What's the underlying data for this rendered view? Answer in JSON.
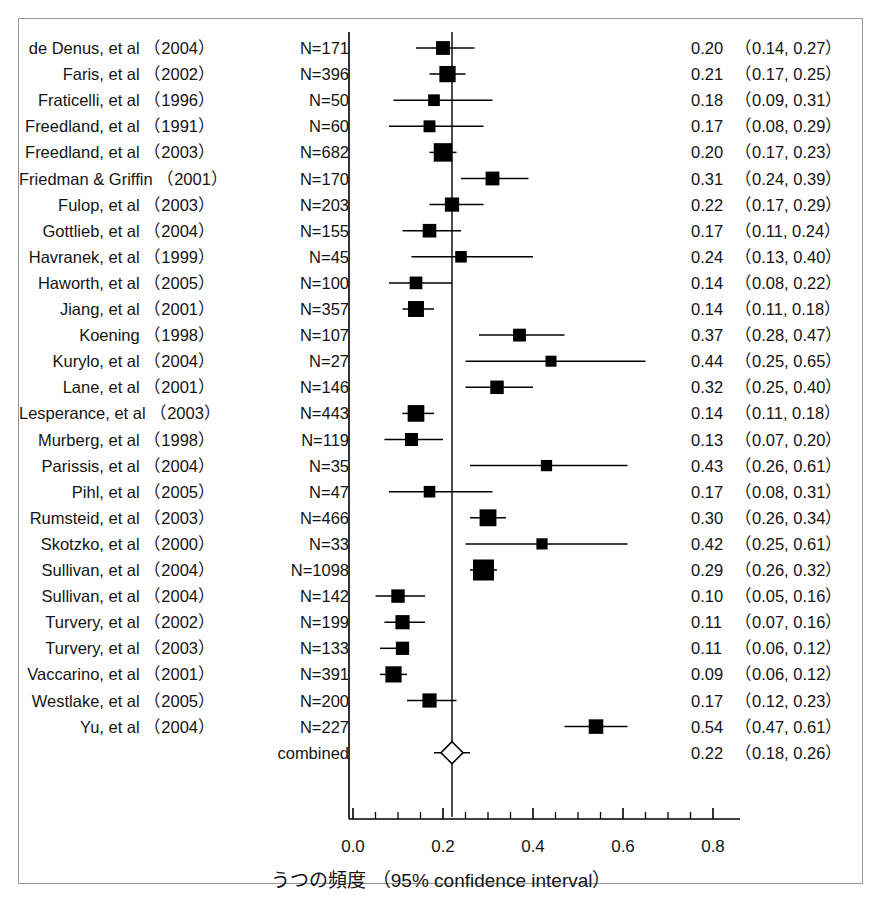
{
  "chart_data": {
    "type": "forest",
    "title": "",
    "xlabel": "うつの頻度 （95% confidence interval）",
    "ylabel": "",
    "xlim": [
      0.0,
      0.86
    ],
    "xticks": [
      0.0,
      0.2,
      0.4,
      0.6,
      0.8
    ],
    "xtick_labels": [
      "0.0",
      "0.2",
      "0.4",
      "0.6",
      "0.8"
    ],
    "minor_tick_step": 0.05,
    "grid": false,
    "legend": "none",
    "reference_line": 0.22,
    "effect_measure": "proportion",
    "combined_label": "combined",
    "combined": {
      "label": "combined",
      "n": null,
      "estimate": 0.22,
      "ci_low": 0.18,
      "ci_high": 0.26,
      "value_text": "0.22",
      "ci_text": "（0.18, 0.26）",
      "marker": "open-diamond"
    },
    "rows": [
      {
        "name": "de Denus, et al （2004）",
        "n_text": "N=171",
        "n": 171,
        "estimate": 0.2,
        "ci_low": 0.14,
        "ci_high": 0.27,
        "value_text": "0.20",
        "ci_text": "（0.14, 0.27）"
      },
      {
        "name": "Faris, et al （2002）",
        "n_text": "N=396",
        "n": 396,
        "estimate": 0.21,
        "ci_low": 0.17,
        "ci_high": 0.25,
        "value_text": "0.21",
        "ci_text": "（0.17, 0.25）"
      },
      {
        "name": "Fraticelli, et al （1996）",
        "n_text": "N=50",
        "n": 50,
        "estimate": 0.18,
        "ci_low": 0.09,
        "ci_high": 0.31,
        "value_text": "0.18",
        "ci_text": "（0.09, 0.31）"
      },
      {
        "name": "Freedland, et al （1991）",
        "n_text": "N=60",
        "n": 60,
        "estimate": 0.17,
        "ci_low": 0.08,
        "ci_high": 0.29,
        "value_text": "0.17",
        "ci_text": "（0.08, 0.29）"
      },
      {
        "name": "Freedland, et al （2003）",
        "n_text": "N=682",
        "n": 682,
        "estimate": 0.2,
        "ci_low": 0.17,
        "ci_high": 0.23,
        "value_text": "0.20",
        "ci_text": "（0.17, 0.23）"
      },
      {
        "name": "Friedman & Griffin （2001）",
        "n_text": "N=170",
        "n": 170,
        "estimate": 0.31,
        "ci_low": 0.24,
        "ci_high": 0.39,
        "value_text": "0.31",
        "ci_text": "（0.24, 0.39）"
      },
      {
        "name": "Fulop, et al （2003）",
        "n_text": "N=203",
        "n": 203,
        "estimate": 0.22,
        "ci_low": 0.17,
        "ci_high": 0.29,
        "value_text": "0.22",
        "ci_text": "（0.17, 0.29）"
      },
      {
        "name": "Gottlieb, et al （2004）",
        "n_text": "N=155",
        "n": 155,
        "estimate": 0.17,
        "ci_low": 0.11,
        "ci_high": 0.24,
        "value_text": "0.17",
        "ci_text": "（0.11, 0.24）"
      },
      {
        "name": "Havranek, et al （1999）",
        "n_text": "N=45",
        "n": 45,
        "estimate": 0.24,
        "ci_low": 0.13,
        "ci_high": 0.4,
        "value_text": "0.24",
        "ci_text": "（0.13, 0.40）"
      },
      {
        "name": "Haworth, et al （2005）",
        "n_text": "N=100",
        "n": 100,
        "estimate": 0.14,
        "ci_low": 0.08,
        "ci_high": 0.22,
        "value_text": "0.14",
        "ci_text": "（0.08, 0.22）"
      },
      {
        "name": "Jiang, et al （2001）",
        "n_text": "N=357",
        "n": 357,
        "estimate": 0.14,
        "ci_low": 0.11,
        "ci_high": 0.18,
        "value_text": "0.14",
        "ci_text": "（0.11, 0.18）"
      },
      {
        "name": "Koening （1998）",
        "n_text": "N=107",
        "n": 107,
        "estimate": 0.37,
        "ci_low": 0.28,
        "ci_high": 0.47,
        "value_text": "0.37",
        "ci_text": "（0.28, 0.47）"
      },
      {
        "name": "Kurylo, et al （2004）",
        "n_text": "N=27",
        "n": 27,
        "estimate": 0.44,
        "ci_low": 0.25,
        "ci_high": 0.65,
        "value_text": "0.44",
        "ci_text": "（0.25, 0.65）"
      },
      {
        "name": "Lane, et al （2001）",
        "n_text": "N=146",
        "n": 146,
        "estimate": 0.32,
        "ci_low": 0.25,
        "ci_high": 0.4,
        "value_text": "0.32",
        "ci_text": "（0.25, 0.40）"
      },
      {
        "name": "Lesperance, et al （2003）",
        "n_text": "N=443",
        "n": 443,
        "estimate": 0.14,
        "ci_low": 0.11,
        "ci_high": 0.18,
        "value_text": "0.14",
        "ci_text": "（0.11, 0.18）"
      },
      {
        "name": "Murberg, et al （1998）",
        "n_text": "N=119",
        "n": 119,
        "estimate": 0.13,
        "ci_low": 0.07,
        "ci_high": 0.2,
        "value_text": "0.13",
        "ci_text": "（0.07, 0.20）"
      },
      {
        "name": "Parissis, et al （2004）",
        "n_text": "N=35",
        "n": 35,
        "estimate": 0.43,
        "ci_low": 0.26,
        "ci_high": 0.61,
        "value_text": "0.43",
        "ci_text": "（0.26, 0.61）"
      },
      {
        "name": "Pihl, et al （2005）",
        "n_text": "N=47",
        "n": 47,
        "estimate": 0.17,
        "ci_low": 0.08,
        "ci_high": 0.31,
        "value_text": "0.17",
        "ci_text": "（0.08, 0.31）"
      },
      {
        "name": "Rumsteid, et al （2003）",
        "n_text": "N=466",
        "n": 466,
        "estimate": 0.3,
        "ci_low": 0.26,
        "ci_high": 0.34,
        "value_text": "0.30",
        "ci_text": "（0.26, 0.34）"
      },
      {
        "name": "Skotzko, et al （2000）",
        "n_text": "N=33",
        "n": 33,
        "estimate": 0.42,
        "ci_low": 0.25,
        "ci_high": 0.61,
        "value_text": "0.42",
        "ci_text": "（0.25, 0.61）"
      },
      {
        "name": "Sullivan, et al （2004）",
        "n_text": "N=1098",
        "n": 1098,
        "estimate": 0.29,
        "ci_low": 0.26,
        "ci_high": 0.32,
        "value_text": "0.29",
        "ci_text": "（0.26, 0.32）"
      },
      {
        "name": "Sullivan, et al （2004）",
        "n_text": "N=142",
        "n": 142,
        "estimate": 0.1,
        "ci_low": 0.05,
        "ci_high": 0.16,
        "value_text": "0.10",
        "ci_text": "（0.05, 0.16）"
      },
      {
        "name": "Turvery, et al （2002）",
        "n_text": "N=199",
        "n": 199,
        "estimate": 0.11,
        "ci_low": 0.07,
        "ci_high": 0.16,
        "value_text": "0.11",
        "ci_text": "（0.07, 0.16）"
      },
      {
        "name": "Turvery, et al （2003）",
        "n_text": "N=133",
        "n": 133,
        "estimate": 0.11,
        "ci_low": 0.06,
        "ci_high": 0.12,
        "value_text": "0.11",
        "ci_text": "（0.06, 0.12）"
      },
      {
        "name": "Vaccarino, et al （2001）",
        "n_text": "N=391",
        "n": 391,
        "estimate": 0.09,
        "ci_low": 0.06,
        "ci_high": 0.12,
        "value_text": "0.09",
        "ci_text": "（0.06, 0.12）"
      },
      {
        "name": "Westlake, et al （2005）",
        "n_text": "N=200",
        "n": 200,
        "estimate": 0.17,
        "ci_low": 0.12,
        "ci_high": 0.23,
        "value_text": "0.17",
        "ci_text": "（0.12, 0.23）"
      },
      {
        "name": "Yu, et al （2004）",
        "n_text": "N=227",
        "n": 227,
        "estimate": 0.54,
        "ci_low": 0.47,
        "ci_high": 0.61,
        "value_text": "0.54",
        "ci_text": "（0.47, 0.61）"
      }
    ]
  },
  "colors": {
    "marker": "#000000",
    "line": "#000000",
    "frame": "#9a9a9a",
    "text": "#141414",
    "diamond_fill": "#ffffff"
  }
}
